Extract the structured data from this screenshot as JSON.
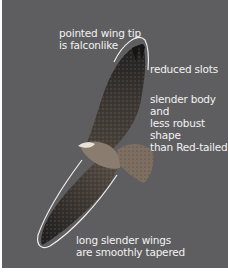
{
  "image": {
    "subject": "hawk in flight, underside view",
    "background_color": "#5e5e60",
    "annotation_color": "#f2f2f2"
  },
  "annotations": [
    {
      "text": "pointed wing tip\nis falconlike"
    },
    {
      "text": "reduced slots"
    },
    {
      "text": "slender body and\nless robust shape\nthan Red-tailed"
    },
    {
      "text": "long slender wings\nare smoothly tapered"
    }
  ]
}
